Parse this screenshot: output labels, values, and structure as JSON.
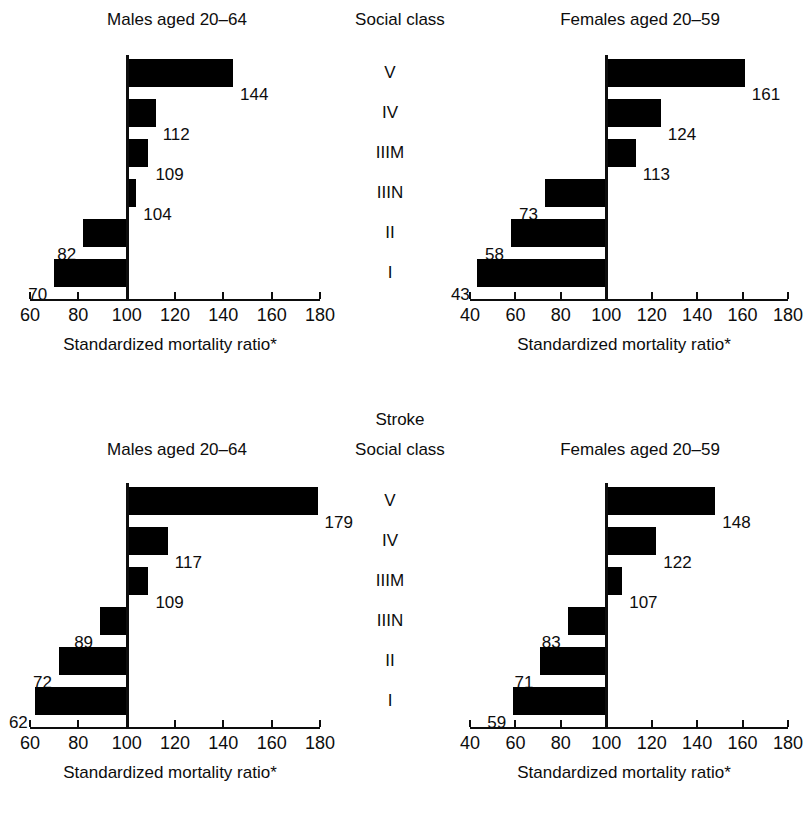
{
  "figure": {
    "section_title": "Stroke",
    "class_column_header": "Social class",
    "axis_title": "Standardized mortality ratio*",
    "social_classes": [
      "V",
      "IV",
      "IIIM",
      "IIIN",
      "II",
      "I"
    ],
    "bar_color": "#000000",
    "text_color": "#0d0d0d",
    "background": "#ffffff"
  },
  "chart_data": [
    {
      "id": "top-left",
      "type": "bar",
      "orientation": "horizontal",
      "title": "Males aged 20–64",
      "xlabel": "Standardized mortality ratio*",
      "ylabel": "Social class",
      "categories": [
        "V",
        "IV",
        "IIIM",
        "IIIN",
        "II",
        "I"
      ],
      "values": [
        144,
        112,
        109,
        104,
        82,
        70
      ],
      "baseline": 100,
      "xlim": [
        60,
        180
      ],
      "xticks": [
        60,
        80,
        100,
        120,
        140,
        160,
        180
      ],
      "ticklabels": [
        "60",
        "80",
        "100",
        "120",
        "140",
        "160",
        "180"
      ],
      "grid": false,
      "legend": false
    },
    {
      "id": "top-right",
      "type": "bar",
      "orientation": "horizontal",
      "title": "Females aged 20–59",
      "xlabel": "Standardized mortality ratio*",
      "ylabel": "Social class",
      "categories": [
        "V",
        "IV",
        "IIIM",
        "IIIN",
        "II",
        "I"
      ],
      "values": [
        161,
        124,
        113,
        73,
        58,
        43
      ],
      "baseline": 100,
      "xlim": [
        40,
        180
      ],
      "xticks": [
        40,
        60,
        80,
        100,
        120,
        140,
        160,
        180
      ],
      "ticklabels": [
        "40",
        "60",
        "80",
        "100",
        "120",
        "140",
        "160",
        "180"
      ],
      "grid": false,
      "legend": false
    },
    {
      "id": "bottom-left",
      "type": "bar",
      "orientation": "horizontal",
      "title": "Males aged 20–64",
      "xlabel": "Standardized mortality ratio*",
      "ylabel": "Social class",
      "categories": [
        "V",
        "IV",
        "IIIM",
        "IIIN",
        "II",
        "I"
      ],
      "values": [
        179,
        117,
        109,
        89,
        72,
        62
      ],
      "baseline": 100,
      "xlim": [
        60,
        180
      ],
      "xticks": [
        60,
        80,
        100,
        120,
        140,
        160,
        180
      ],
      "ticklabels": [
        "60",
        "80",
        "100",
        "120",
        "140",
        "160",
        "180"
      ],
      "grid": false,
      "legend": false
    },
    {
      "id": "bottom-right",
      "type": "bar",
      "orientation": "horizontal",
      "title": "Females aged 20–59",
      "xlabel": "Standardized mortality ratio*",
      "ylabel": "Social class",
      "categories": [
        "V",
        "IV",
        "IIIM",
        "IIIN",
        "II",
        "I"
      ],
      "values": [
        148,
        122,
        107,
        83,
        71,
        59
      ],
      "baseline": 100,
      "xlim": [
        40,
        180
      ],
      "xticks": [
        40,
        60,
        80,
        100,
        120,
        140,
        160,
        180
      ],
      "ticklabels": [
        "40",
        "60",
        "80",
        "100",
        "120",
        "140",
        "160",
        "180"
      ],
      "grid": false,
      "legend": false
    }
  ]
}
